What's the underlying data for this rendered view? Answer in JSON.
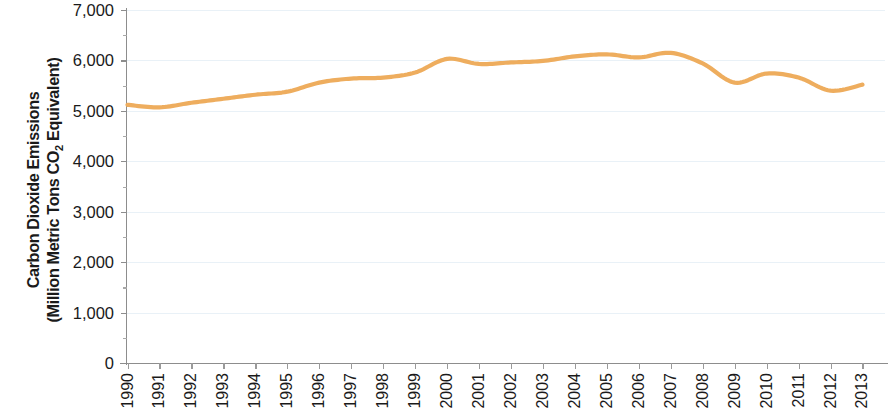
{
  "chart_data": {
    "type": "line",
    "title": "",
    "xlabel": "",
    "ylabel_line1": "Carbon Dioxide Emissions",
    "ylabel_line2_pre": "(Million Metric Tons CO",
    "ylabel_line2_sub": "2",
    "ylabel_line2_post": " Equivalent)",
    "ylim": [
      0,
      7000
    ],
    "ytick_labels": [
      "7,000",
      "6,000",
      "5,000",
      "4,000",
      "3,000",
      "2,000",
      "1,000",
      "0"
    ],
    "ytick_values": [
      7000,
      6000,
      5000,
      4000,
      3000,
      2000,
      1000,
      0
    ],
    "yminor_values": [
      6500,
      5500,
      4500,
      3500,
      2500,
      1500,
      500
    ],
    "grid": true,
    "legend": "none",
    "series_color": "#eead5e",
    "categories": [
      "1990",
      "1991",
      "1992",
      "1993",
      "1994",
      "1995",
      "1996",
      "1997",
      "1998",
      "1999",
      "2000",
      "2001",
      "2002",
      "2003",
      "2004",
      "2005",
      "2006",
      "2007",
      "2008",
      "2009",
      "2010",
      "2011",
      "2012",
      "2013"
    ],
    "values": [
      5120,
      5070,
      5160,
      5240,
      5320,
      5380,
      5560,
      5640,
      5660,
      5760,
      6030,
      5930,
      5960,
      5990,
      6080,
      6120,
      6060,
      6150,
      5940,
      5560,
      5740,
      5660,
      5400,
      5520
    ]
  }
}
